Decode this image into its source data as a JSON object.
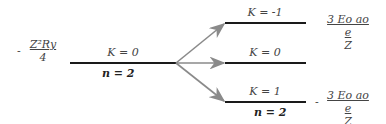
{
  "diagram": {
    "left_level": {
      "energy_sign": "-",
      "energy_numerator": "Z²Ry",
      "energy_denominator": "4",
      "k_label": "K = 0",
      "n_label": "n = 2"
    },
    "right_levels": [
      {
        "k_label": "K = -1",
        "energy_sign": "",
        "energy_numerator": "3 Eo ao e",
        "energy_denominator": "Z"
      },
      {
        "k_label": "K = 0",
        "energy_sign": "",
        "energy_numerator": "",
        "energy_denominator": ""
      },
      {
        "k_label": "K = 1",
        "energy_sign": "-",
        "energy_numerator": "3 Eo ao e",
        "energy_denominator": "Z"
      }
    ],
    "right_n_label": "n = 2",
    "colors": {
      "level_line": "#1a1a1a",
      "arrow": "#8a8a8a"
    }
  }
}
